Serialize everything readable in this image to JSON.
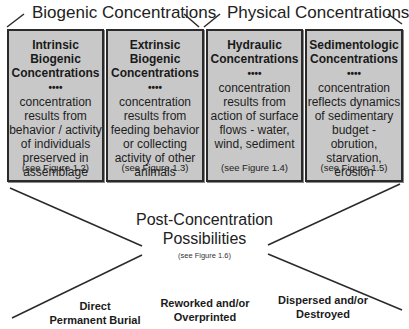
{
  "groups": [
    {
      "label": "Biogenic Concentrations"
    },
    {
      "label": "Physical Concentrations"
    }
  ],
  "boxes": [
    {
      "title1": "Intrinsic Biogenic",
      "title2": "Concentrations",
      "dots": "••••",
      "desc": [
        "concentration",
        "results from",
        "behavior / activity",
        "of individuals",
        "preserved in",
        "assemblage"
      ],
      "ref": "(see Figure 1.2)"
    },
    {
      "title1": "Extrinsic Biogenic",
      "title2": "Concentrations",
      "dots": "••••",
      "desc": [
        "concentration",
        "results from",
        "feeding behavior",
        "or collecting",
        "activity of other",
        "animals"
      ],
      "ref": "(see Figure 1.3)"
    },
    {
      "title1": "Hydraulic",
      "title2": "Concentrations",
      "dots": "••••",
      "desc": [
        "concentration",
        "results from",
        "action of surface",
        "flows - water,",
        "wind, sediment"
      ],
      "ref": "(see Figure 1.4)"
    },
    {
      "title1": "Sedimentologic",
      "title2": "Concentrations",
      "dots": "••••",
      "desc": [
        "concentration",
        "reflects dynamics",
        "of sedimentary",
        "budget - obrution,",
        "starvation, erosion"
      ],
      "ref": "(see Figure 1.5)"
    }
  ],
  "center": {
    "line1": "Post-Concentration",
    "line2": "Possibilities",
    "ref": "(see Figure 1.6)"
  },
  "outcomes": [
    {
      "line1": "Direct",
      "line2": "Permanent Burial"
    },
    {
      "line1": "Reworked and/or",
      "line2": "Overprinted"
    },
    {
      "line1": "Dispersed and/or",
      "line2": "Destroyed"
    }
  ],
  "colors": {
    "box_fill": "#c8c8c8",
    "box_border": "#2a2a2a",
    "line": "#2a2a2a"
  }
}
